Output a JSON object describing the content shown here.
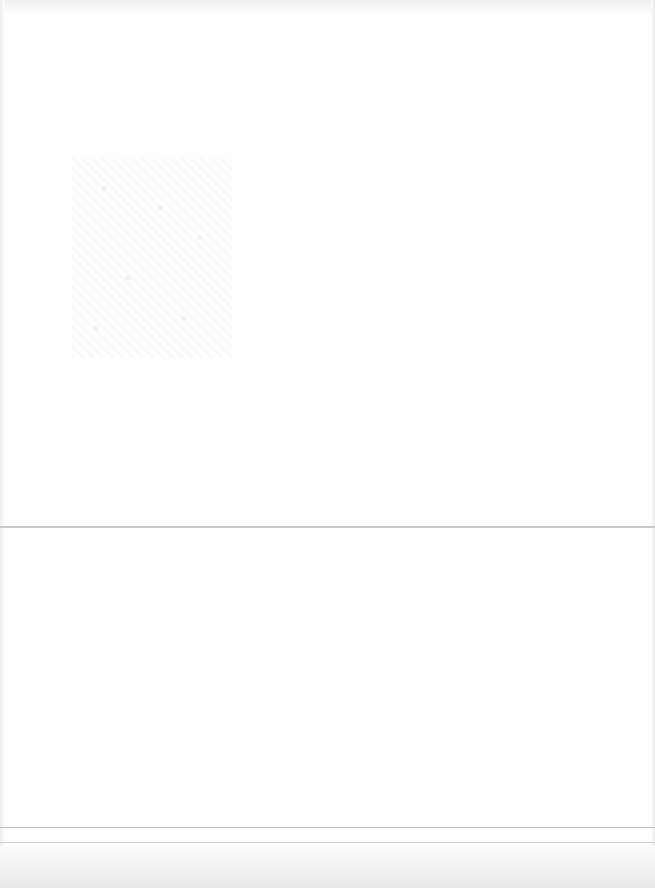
{
  "page": {
    "visible_text": [],
    "rules": [
      {
        "name": "middle-rule",
        "y": 526
      },
      {
        "name": "bottom-rule-1",
        "y": 827
      },
      {
        "name": "bottom-rule-2",
        "y": 842
      }
    ],
    "colors": {
      "background": "#fefefe",
      "rule": "#c9c9c9",
      "edge_shadow": "#e8e8e8"
    }
  }
}
